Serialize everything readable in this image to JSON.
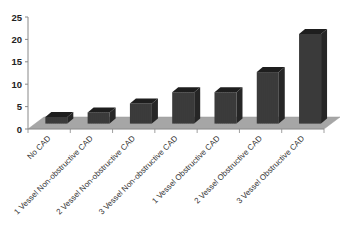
{
  "chart_data": {
    "type": "bar",
    "style": "3d-column",
    "title": "",
    "xlabel": "",
    "ylabel": "",
    "ylim": [
      0,
      25
    ],
    "yticks": [
      0,
      5,
      10,
      15,
      20,
      25
    ],
    "grid": false,
    "legend": null,
    "categories": [
      "No CAD",
      "1 Vessel Non-obstructive CAD",
      "2 Vessel Non-obstructive CAD",
      "3 Vessel Non-obstructive CAD",
      "1 Vessel Obstructive CAD",
      "2 Vessel Obstructive CAD",
      "3 Vessel Obstructive CAD"
    ],
    "values": [
      1.5,
      2.5,
      4.5,
      7,
      7,
      11.5,
      20
    ],
    "colors": {
      "bar_front": "#3a3a3a",
      "bar_top": "#1e1e1e",
      "bar_side": "#262626",
      "floor": "#a6a6a6",
      "axis": "#888888"
    }
  }
}
